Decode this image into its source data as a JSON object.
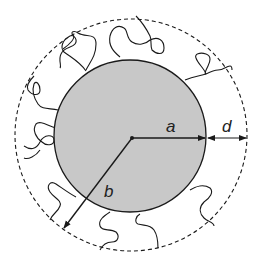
{
  "diagram": {
    "colors": {
      "core_fill": "#c8c8c8",
      "stroke": "#1a1a1a",
      "background": "#ffffff"
    },
    "geometry": {
      "center": [
        131,
        138
      ],
      "core_radius": 76,
      "outer_radius": 115
    },
    "labels": {
      "a": "a",
      "b": "b",
      "d": "d"
    }
  }
}
